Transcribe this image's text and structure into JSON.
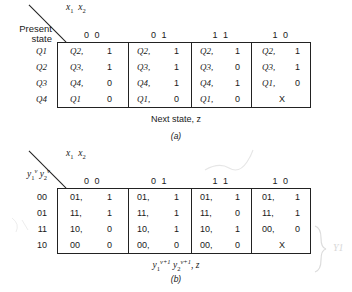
{
  "figure_a": {
    "input_vars_label": "x",
    "input_var_subs": [
      "1",
      "2"
    ],
    "row_header_lines": [
      "Present",
      "state"
    ],
    "column_headers": [
      "0 0",
      "0 1",
      "1 1",
      "1 0"
    ],
    "row_labels": [
      "Q1",
      "Q2",
      "Q3",
      "Q4"
    ],
    "rows": [
      [
        {
          "state": "Q2,",
          "out": "1"
        },
        {
          "state": "Q2,",
          "out": "1"
        },
        {
          "state": "Q2,",
          "out": "1"
        },
        {
          "state": "Q2,",
          "out": "1"
        }
      ],
      [
        {
          "state": "Q3,",
          "out": "1"
        },
        {
          "state": "Q3,",
          "out": "1"
        },
        {
          "state": "Q3,",
          "out": "0"
        },
        {
          "state": "Q3,",
          "out": "1"
        }
      ],
      [
        {
          "state": "Q4,",
          "out": "0"
        },
        {
          "state": "Q4,",
          "out": "1"
        },
        {
          "state": "Q4,",
          "out": "1"
        },
        {
          "state": "Q1,",
          "out": "0"
        }
      ],
      [
        {
          "state": "Q1",
          "out": "0"
        },
        {
          "state": "Q1,",
          "out": "0"
        },
        {
          "state": "Q1,",
          "out": "0"
        },
        {
          "state": "X",
          "out": ""
        }
      ]
    ],
    "caption": "Next state, z",
    "label": "(a)"
  },
  "figure_b": {
    "input_vars_label": "x",
    "input_var_subs": [
      "1",
      "2"
    ],
    "row_header_math": "y1ᵛ y2ᵛ",
    "column_headers": [
      "0 0",
      "0 1",
      "1 1",
      "1 0"
    ],
    "row_labels": [
      "00",
      "01",
      "11",
      "10"
    ],
    "rows": [
      [
        {
          "state": "01,",
          "out": "1"
        },
        {
          "state": "01,",
          "out": "1"
        },
        {
          "state": "01,",
          "out": "1"
        },
        {
          "state": "01,",
          "out": "1"
        }
      ],
      [
        {
          "state": "11,",
          "out": "1"
        },
        {
          "state": "11,",
          "out": "1"
        },
        {
          "state": "11,",
          "out": "0"
        },
        {
          "state": "11,",
          "out": "1"
        }
      ],
      [
        {
          "state": "10,",
          "out": "0"
        },
        {
          "state": "10,",
          "out": "1"
        },
        {
          "state": "10,",
          "out": "1"
        },
        {
          "state": "00,",
          "out": "0"
        }
      ],
      [
        {
          "state": "00",
          "out": "0"
        },
        {
          "state": "00,",
          "out": "0"
        },
        {
          "state": "00,",
          "out": "0"
        },
        {
          "state": "X",
          "out": ""
        }
      ]
    ],
    "caption_math": "y1ᵛ⁺¹ y2ᵛ⁺¹, z",
    "label": "(b)",
    "annotation": "Y1"
  }
}
